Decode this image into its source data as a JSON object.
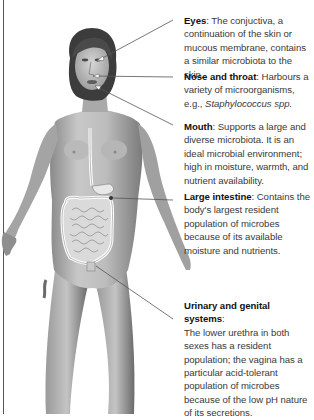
{
  "diagram": {
    "type": "anatomical-annotation",
    "colors": {
      "background": "#ffffff",
      "skin_light": "#d2d2d2",
      "skin_mid": "#a8a8a8",
      "skin_dark": "#6e6e6e",
      "hair": "#3c3c3c",
      "gut_outline": "#ffffff",
      "leader_line": "#555555",
      "title_text": "#111111",
      "body_text": "#3a3a3a"
    }
  },
  "annotations": [
    {
      "title": "Eyes",
      "separator": ": ",
      "text": "The conjuctiva, a continuation of the skin or mucous membrane, contains a similar microbiota to the skin.",
      "italic": ""
    },
    {
      "title": "Nose and throat",
      "separator": ": ",
      "text": "Harbours a variety of microorganisms, e.g.,",
      "italic": "Staphylococcus spp."
    },
    {
      "title": "Mouth",
      "separator": ": ",
      "text": "Supports a large and diverse microbiota. It is an ideal microbial environment; high in moisture, warmth, and nutrient availability.",
      "italic": ""
    },
    {
      "title": "Large intestine",
      "separator": ": ",
      "text": "Contains the body's largest resident population of microbes because of its available moisture and nutrients.",
      "italic": ""
    },
    {
      "title": "Urinary and genital systems",
      "separator": ":",
      "text": "The lower urethra in both sexes has a resident population; the vagina has a particular acid-tolerant population of microbes because of the low pH nature of its secretions.",
      "italic": ""
    }
  ]
}
